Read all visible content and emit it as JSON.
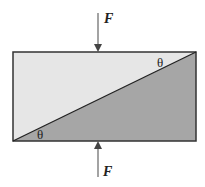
{
  "diagram": {
    "type": "block-with-inclined-plane",
    "colors": {
      "light_fill": "#e6e6e6",
      "dark_fill": "#a6a6a6",
      "stroke": "#333333",
      "arrow": "#444444"
    },
    "forces": {
      "top": {
        "label": "F",
        "direction": "down"
      },
      "bottom": {
        "label": "F",
        "direction": "up"
      }
    },
    "angles": {
      "top_right": "θ",
      "bottom_left": "θ"
    }
  }
}
